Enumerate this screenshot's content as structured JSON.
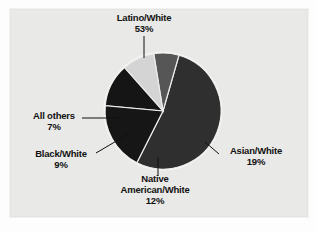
{
  "figure": {
    "background_color": "#e9e9e7",
    "outer_background_color": "#fdfdfd",
    "text_color": "#111111"
  },
  "chart_data": {
    "type": "pie",
    "title": "",
    "subtitle": "",
    "xlabel": "",
    "ylabel": "",
    "legend_position": "none",
    "grid": false,
    "labels_in_chart": true,
    "categories": [
      "Latino/White",
      "Asian/White",
      "Native American/White",
      "Black/White",
      "All others"
    ],
    "values": [
      53,
      19,
      12,
      9,
      7
    ],
    "value_suffix": "%",
    "colors": [
      "#2f2f2f",
      "#161616",
      "#151515",
      "#d4d4d4",
      "#565656"
    ],
    "slice_order": "clockwise",
    "start_angle_deg": -74,
    "slices": [
      {
        "name": "Latino/White",
        "value": 53,
        "value_label": "53%",
        "color": "#2f2f2f",
        "label_text": "Latino/White",
        "leader": "vertical-up"
      },
      {
        "name": "Asian/White",
        "value": 19,
        "value_label": "19%",
        "color": "#161616",
        "label_text": "Asian/White",
        "leader": "diagonal-right"
      },
      {
        "name": "Native American/White",
        "value": 12,
        "value_label": "12%",
        "color": "#151515",
        "label_text": "Native American/White",
        "label_line1": "Native",
        "label_line2": "American/White",
        "leader": "vertical-down"
      },
      {
        "name": "Black/White",
        "value": 9,
        "value_label": "9%",
        "color": "#d4d4d4",
        "label_text": "Black/White",
        "leader": "diagonal-left"
      },
      {
        "name": "All others",
        "value": 7,
        "value_label": "7%",
        "color": "#565656",
        "label_text": "All others",
        "leader": "horizontal-left"
      }
    ]
  },
  "labels": {
    "latino": {
      "name": "Latino/White",
      "pct": "53%"
    },
    "asian": {
      "name": "Asian/White",
      "pct": "19%"
    },
    "native": {
      "line1": "Native",
      "line2": "American/White",
      "pct": "12%"
    },
    "black": {
      "name": "Black/White",
      "pct": "9%"
    },
    "allothers": {
      "name": "All others",
      "pct": "7%"
    }
  }
}
